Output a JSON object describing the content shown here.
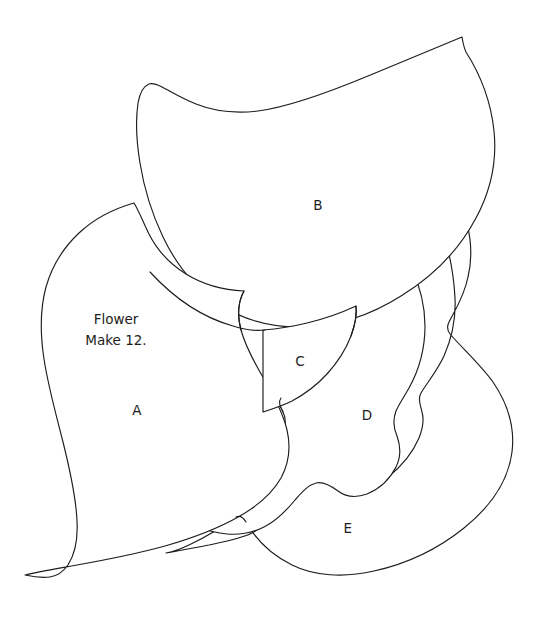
{
  "document": {
    "kind": "sewing-pattern-template",
    "title": "Flower",
    "background_color": "#ffffff",
    "line_color": "#1d1d1d",
    "width": 538,
    "height": 640
  },
  "note": {
    "line1": "Flower",
    "line2": "Make 12.",
    "x": 116,
    "y": 324
  },
  "pieces": [
    {
      "id": "A",
      "label": "A",
      "label_x": 137,
      "label_y": 411,
      "name": "petal-a"
    },
    {
      "id": "B",
      "label": "B",
      "label_x": 318,
      "label_y": 206,
      "name": "petal-b"
    },
    {
      "id": "C",
      "label": "C",
      "label_x": 300,
      "label_y": 362,
      "name": "petal-c"
    },
    {
      "id": "D",
      "label": "D",
      "label_x": 367,
      "label_y": 416,
      "name": "petal-d"
    },
    {
      "id": "E",
      "label": "E",
      "label_x": 348,
      "label_y": 529,
      "name": "petal-e"
    }
  ],
  "paths": {
    "petal_e": "M 460,200 C 470,228 474,252 468,277 C 464,297 455,310 449,322 C 447,326 447,330 450,334 C 462,348 480,364 493,382 C 508,404 515,428 512,452 C 508,482 489,508 464,528 C 438,549 406,564 374,571 C 344,578 314,576 292,565 C 272,555 256,540 246,522 C 243,517 240,515 236,517 C 222,527 206,537 191,544 C 181,549 172,552 166,553 C 178,551 193,548 209,545 C 228,541 243,538 252,533 C 262,528 270,520 277,511 C 288,497 297,483 305,476 C 312,470 319,470 326,476 C 334,483 343,490 352,491 C 364,492 376,486 388,477 C 402,466 413,452 419,438 C 423,428 424,419 422,412 C 420,404 418,398 421,393 C 427,383 437,371 444,356 C 452,338 456,318 455,298 C 454,277 450,256 445,238 C 442,227 440,218 441,211 C 443,203 450,199 460,200 Z",
    "petal_d": "M 411,267 C 420,286 425,306 425,326 C 425,349 419,370 409,388 C 404,397 399,404 396,411 C 393,419 393,427 397,436 C 401,447 401,457 396,467 C 390,479 379,489 367,494 C 356,498 346,497 338,491 C 330,485 323,481 316,483 C 308,485 302,492 295,500 C 286,511 276,521 264,527 C 252,533 239,535 227,534 C 217,533 209,531 203,528 C 212,522 222,514 232,505 C 246,492 259,478 268,465 C 275,454 280,444 283,435 C 286,426 286,418 283,412 C 280,406 278,402 281,398 C 290,387 303,374 315,358 C 329,339 340,318 347,298 C 353,281 355,266 353,254 C 352,245 350,239 348,234 C 356,239 366,246 377,253 C 390,260 401,264 411,267 Z",
    "petal_b": "M 462,37 C 438,47 404,61 368,76 C 327,93 289,107 258,111 C 232,114 211,110 196,104 C 181,98 170,91 162,87 C 156,84 152,83 149,84 C 144,86 140,92 138,103 C 136,117 136,139 140,163 C 144,188 152,214 163,237 C 176,264 195,288 219,304 C 243,320 272,328 304,327 C 337,326 371,315 401,296 C 432,277 459,250 476,218 C 491,190 497,160 494,131 C 491,102 480,74 466,52 C 464,48 463,43 462,37 Z",
    "petal_a": "M 134,203 C 113,209 94,219 79,233 C 63,248 52,266 46,287 C 40,309 40,333 44,359 C 48,386 56,414 63,442 C 70,470 76,497 77,521 C 78,539 75,554 68,565 C 63,572 57,576 50,577 C 42,578 34,577 25,575 C 37,572 55,569 77,565 C 105,560 136,554 165,546 C 193,538 219,528 240,516 C 259,505 273,492 281,478 C 289,463 291,447 287,430 C 283,413 274,396 264,379 C 254,362 245,345 241,330 C 237,315 238,302 244,291 C 222,290 202,284 186,274 C 170,264 157,250 149,234 C 143,222 139,211 134,203 Z",
    "petal_c": "M 263,330 L 263,412 C 272,409 282,406 292,401 C 305,394 317,385 327,374 C 338,362 346,349 351,336 C 355,325 357,315 356,306 C 341,313 324,319 307,323 C 291,327 276,329 263,330 Z",
    "seam_b_bottom": "M 150,272 C 172,296 201,317 233,326 C 245,330 256,331 265,330",
    "seam_c_right_upper": "M 356,306 C 357,315 355,325 351,336",
    "seam_a_right_lower": "M 241,330 C 237,315 238,302 244,291",
    "seam_e_top_left": "M 236,517 C 240,515 243,517 246,522",
    "seam_d_notch": "M 283,412 C 280,406 278,402 281,398"
  }
}
